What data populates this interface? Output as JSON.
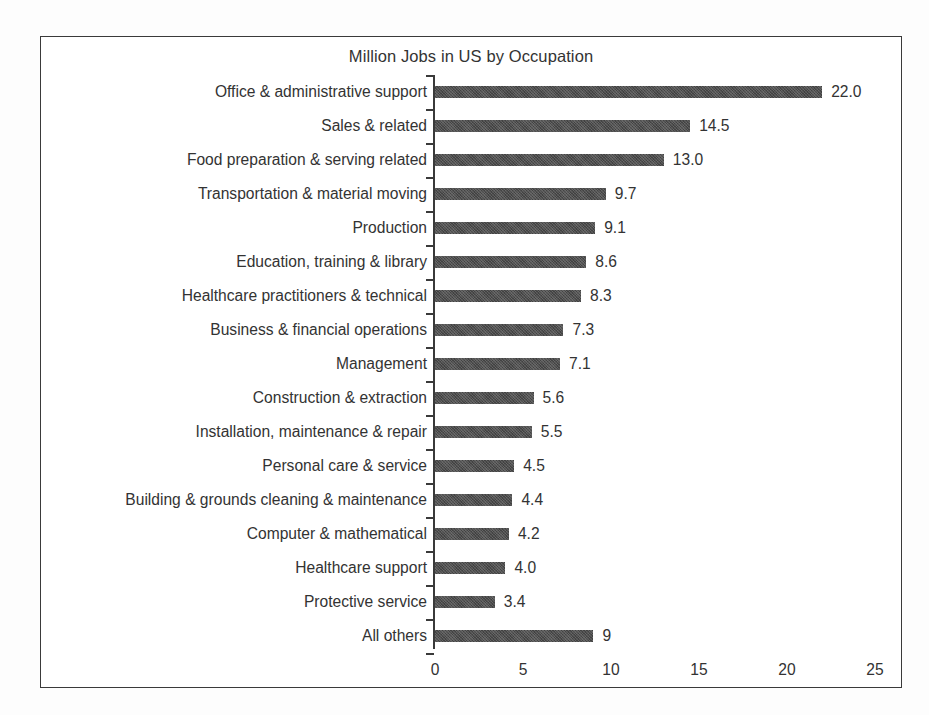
{
  "chart_data": {
    "type": "bar",
    "orientation": "horizontal",
    "title": "Million Jobs in US by Occupation",
    "xlabel": "",
    "ylabel": "",
    "xlim": [
      0,
      25
    ],
    "xticks": [
      "0",
      "5",
      "10",
      "15",
      "20",
      "25"
    ],
    "xtick_values": [
      0,
      5,
      10,
      15,
      20,
      25
    ],
    "grid": false,
    "legend": false,
    "bar_color": "#4f4f4f",
    "categories": [
      "Office & administrative support",
      "Sales & related",
      "Food preparation & serving related",
      "Transportation & material moving",
      "Production",
      "Education, training & library",
      "Healthcare practitioners & technical",
      "Business & financial operations",
      "Management",
      "Construction & extraction",
      "Installation, maintenance & repair",
      "Personal care & service",
      "Building & grounds cleaning & maintenance",
      "Computer & mathematical",
      "Healthcare support",
      "Protective service",
      "All others"
    ],
    "values": [
      22.0,
      14.5,
      13.0,
      9.7,
      9.1,
      8.6,
      8.3,
      7.3,
      7.1,
      5.6,
      5.5,
      4.5,
      4.4,
      4.2,
      4.0,
      3.4,
      9
    ],
    "value_labels": [
      "22.0",
      "14.5",
      "13.0",
      "9.7",
      "9.1",
      "8.6",
      "8.3",
      "7.3",
      "7.1",
      "5.6",
      "5.5",
      "4.5",
      "4.4",
      "4.2",
      "4.0",
      "3.4",
      "9"
    ]
  }
}
